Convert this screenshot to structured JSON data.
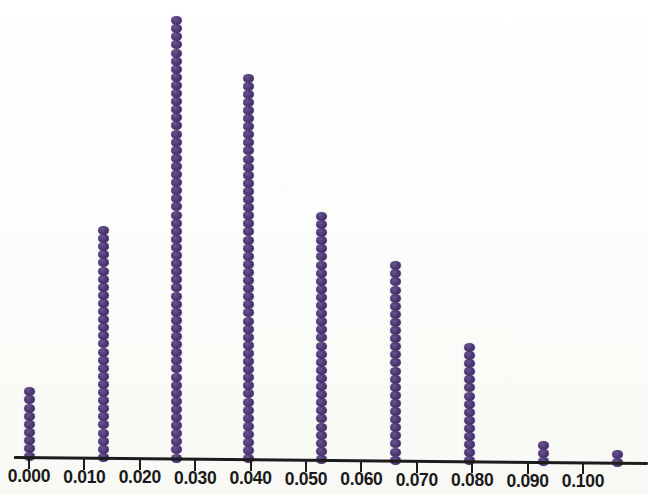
{
  "figure": {
    "kind": "dotplot",
    "background_color": "#fdfdfb",
    "dot_color": "#4c3874",
    "axis_color": "#1c1c1c",
    "width": 648,
    "height": 495
  },
  "axis": {
    "name": "horizontal-value-axis",
    "x_start_px": 14,
    "x_end_px": 648,
    "y_px": 456,
    "slope_deg": 0.55,
    "tick_length_px": 11,
    "tick_label_y_px": 466,
    "tick_spacing_px": 55.4,
    "origin_px": 29.0
  },
  "chart_data": {
    "type": "scatter",
    "title": "",
    "subtitle": "",
    "xlabel": "",
    "ylabel": "",
    "legend": [],
    "grid": false,
    "xlim": [
      -0.0025,
      0.1115
    ],
    "ylim": [
      0,
      56
    ],
    "xtick_labels": [
      "0.000",
      "0.010",
      "0.020",
      "0.030",
      "0.040",
      "0.050",
      "0.060",
      "0.070",
      "0.080",
      "0.090",
      "0.100"
    ],
    "xtick_values": [
      0.0,
      0.01,
      0.02,
      0.03,
      0.04,
      0.05,
      0.06,
      0.07,
      0.08,
      0.09,
      0.1
    ],
    "bin_width": 0.0132,
    "dot_size_px": 10,
    "dot_pitch_px": 8.1,
    "categories": [
      0.0,
      0.0132,
      0.0264,
      0.0396,
      0.0528,
      0.066,
      0.0792,
      0.0924,
      0.1056
    ],
    "values": [
      9,
      29,
      55,
      48,
      31,
      25,
      15,
      3,
      2
    ],
    "columns": [
      {
        "label": "0.000",
        "x_value": 0.0,
        "x_px": 29,
        "count": 9
      },
      {
        "label": "0.013",
        "x_value": 0.0132,
        "x_px": 103,
        "count": 29
      },
      {
        "label": "0.026",
        "x_value": 0.0264,
        "x_px": 176,
        "count": 55
      },
      {
        "label": "0.040",
        "x_value": 0.0396,
        "x_px": 248,
        "count": 48
      },
      {
        "label": "0.053",
        "x_value": 0.0528,
        "x_px": 321,
        "count": 31
      },
      {
        "label": "0.066",
        "x_value": 0.066,
        "x_px": 395,
        "count": 25
      },
      {
        "label": "0.079",
        "x_value": 0.0792,
        "x_px": 469,
        "count": 15
      },
      {
        "label": "0.092",
        "x_value": 0.0924,
        "x_px": 543,
        "count": 3
      },
      {
        "label": "0.106",
        "x_value": 0.1056,
        "x_px": 617,
        "count": 2
      }
    ],
    "total_count": 217
  }
}
